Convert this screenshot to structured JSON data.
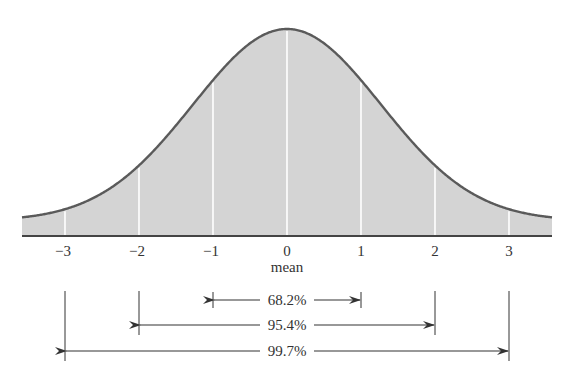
{
  "chart_data": {
    "type": "area",
    "title": "",
    "xlabel": "mean",
    "ylabel": "",
    "x_ticks": [
      -3,
      -2,
      -1,
      0,
      1,
      2,
      3
    ],
    "x_tick_labels": [
      "−3",
      "−2",
      "−1",
      "0",
      "1",
      "2",
      "3"
    ],
    "xlim": [
      -3.58,
      3.58
    ],
    "mean_label": "mean",
    "intervals": [
      {
        "range": [
          -1,
          1
        ],
        "label": "68.2%",
        "percent": 68.2
      },
      {
        "range": [
          -2,
          2
        ],
        "label": "95.4%",
        "percent": 95.4
      },
      {
        "range": [
          -3,
          3
        ],
        "label": "99.7%",
        "percent": 99.7
      }
    ],
    "grid": false,
    "legend": null,
    "colors": {
      "fill": "#d4d4d4",
      "curve": "#5a5a5a",
      "sigma_lines": "#ffffff",
      "axis": "#444444",
      "annotation": "#333333"
    }
  }
}
